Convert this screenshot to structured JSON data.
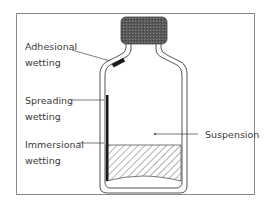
{
  "figure": {
    "labels": {
      "adhesional": [
        "Adhesional",
        "wetting"
      ],
      "spreading": [
        "Spreading",
        "wetting"
      ],
      "immersional": [
        "Immersional",
        "wetting"
      ],
      "suspension": "Suspension"
    },
    "colors": {
      "frame": "#8a8a8a",
      "outline": "#555555",
      "cap": "#5a5a5a",
      "wetting_bar": "#1a1a1a",
      "hatch": "#666666",
      "text": "#3a3a3a"
    }
  }
}
